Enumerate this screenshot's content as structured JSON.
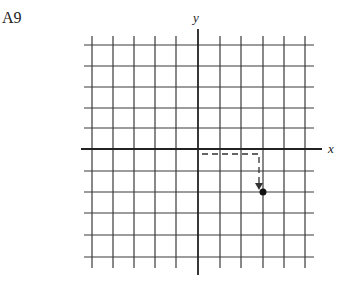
{
  "figure_label": "A9",
  "axes": {
    "x_label": "x",
    "y_label": "y"
  },
  "grid": {
    "vertical_lines_x": [
      92,
      113,
      134,
      155,
      176,
      220,
      241,
      263,
      284,
      305
    ],
    "horizontal_lines_y": [
      45,
      66,
      87,
      108,
      128,
      171,
      192,
      213,
      235,
      257
    ],
    "origin": [
      198,
      149
    ],
    "unit_px": 21.5
  },
  "point": {
    "x": 3,
    "y": -2,
    "marker": "filled-circle"
  },
  "path": {
    "style": "dashed",
    "description": "dashed arrow from origin right 3 units then down 2 units to the point"
  },
  "colors": {
    "line": "#333333",
    "background": "#ffffff"
  }
}
